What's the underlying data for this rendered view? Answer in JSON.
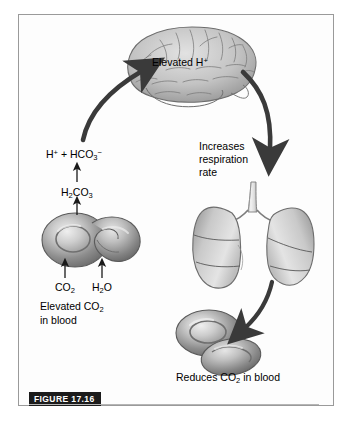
{
  "figure": {
    "tag": "FIGURE 17.16",
    "domain": "physiology-diagram"
  },
  "labels": {
    "brain_stimulus": "Elevated H",
    "brain_stimulus_charge": "+",
    "bicarbonate_formula_a": "H",
    "bicarbonate_formula_b": " + HCO",
    "bicarbonate_formula_sub": "3",
    "carbonic_acid_h": "H",
    "carbonic_acid_sub1": "2",
    "carbonic_acid_co": "CO",
    "carbonic_acid_sub2": "3",
    "co2_label": "CO",
    "co2_sub": "2",
    "h2o_label_h": "H",
    "h2o_sub": "2",
    "h2o_label_o": "O",
    "elevated_co2_line1_a": "Elevated CO",
    "elevated_co2_line1_sub": "2",
    "elevated_co2_line2": "in blood",
    "respiration_line1": "Increases",
    "respiration_line2": "respiration",
    "respiration_line3": "rate",
    "reduces_a": "Reduces CO",
    "reduces_sub": "2",
    "reduces_b": " in blood"
  },
  "organs": [
    {
      "name": "brain",
      "caption": "Elevated H+"
    },
    {
      "name": "lungs",
      "caption": "Increases respiration rate"
    },
    {
      "name": "red-blood-cells-left",
      "caption": "Elevated CO2 in blood"
    },
    {
      "name": "red-blood-cells-right",
      "caption": "Reduces CO2 in blood"
    }
  ],
  "flow_arrows": [
    {
      "name": "h-to-brain",
      "from": "H+ + HCO3-",
      "to": "brain",
      "direction": "up-right-curve"
    },
    {
      "name": "brain-to-lungs",
      "from": "brain",
      "to": "lungs",
      "direction": "down-right-curve"
    },
    {
      "name": "lungs-to-rbc",
      "from": "lungs",
      "to": "red-blood-cells-right",
      "direction": "down-left-curve"
    },
    {
      "name": "co2-into-rbc",
      "from": "CO2",
      "to": "red-blood-cells-left",
      "direction": "up"
    },
    {
      "name": "h2o-into-rbc",
      "from": "H2O",
      "to": "red-blood-cells-left",
      "direction": "up"
    },
    {
      "name": "rbc-to-carbonic-acid",
      "from": "red-blood-cells-left",
      "to": "H2CO3",
      "direction": "up"
    },
    {
      "name": "carbonic-acid-to-ions",
      "from": "H2CO3",
      "to": "H+ + HCO3-",
      "direction": "up"
    }
  ],
  "colors": {
    "frame_border": "#9a9a9a",
    "background": "#fdfdfd",
    "arrow": "#3a3a3a",
    "organ_light": "#d8d8d8",
    "organ_mid": "#a8a8a8",
    "organ_dark": "#6e6e6e",
    "text": "#000000",
    "tag_background": "#1b1b1b",
    "tag_text": "#ffffff"
  }
}
